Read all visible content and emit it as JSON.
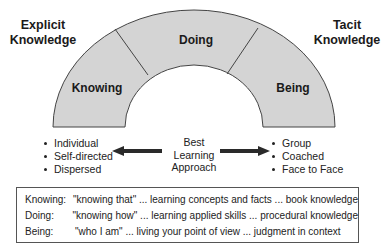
{
  "titles": {
    "left": [
      "Explicit",
      "Knowledge"
    ],
    "right": [
      "Tacit",
      "Knowledge"
    ]
  },
  "arch": {
    "fill": "#d4d4d4",
    "stroke": "#444444",
    "segments": [
      {
        "label": "Knowing"
      },
      {
        "label": "Doing"
      },
      {
        "label": "Being"
      }
    ]
  },
  "left_list": [
    "Individual",
    "Self-directed",
    "Dispersed"
  ],
  "right_list": [
    "Group",
    "Coached",
    "Face to Face"
  ],
  "center": {
    "lines": [
      "Best",
      "Learning",
      "Approach"
    ]
  },
  "arrows": {
    "left": "arrow-left",
    "right": "arrow-right",
    "color": "#2a2a2a"
  },
  "definitions": [
    {
      "term": "Knowing:",
      "text": "\"knowing that\" ... learning concepts and facts ... book knowledge"
    },
    {
      "term": "Doing:",
      "text": "\"knowing how\" ... learning applied skills ... procedural knowledge"
    },
    {
      "term": "Being:",
      "text": "\"who I am\" ... living your point of view ... judgment in context"
    }
  ]
}
